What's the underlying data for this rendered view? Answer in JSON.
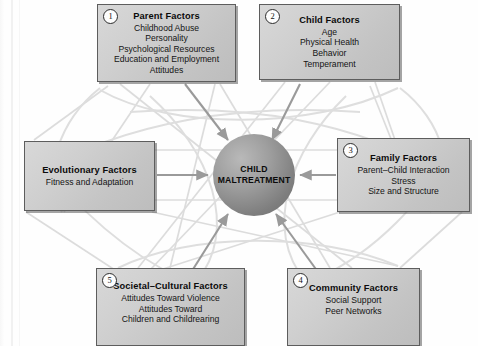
{
  "diagram": {
    "center": {
      "line1": "CHILD",
      "line2": "MALTREATMENT"
    },
    "boxes": [
      {
        "id": "parent-factors",
        "number": "1",
        "title": "Parent Factors",
        "items": [
          "Childhood Abuse",
          "Personality",
          "Psychological Resources",
          "Education and Employment",
          "Attitudes"
        ]
      },
      {
        "id": "child-factors",
        "number": "2",
        "title": "Child Factors",
        "items": [
          "Age",
          "Physical Health",
          "Behavior",
          "Temperament"
        ]
      },
      {
        "id": "family-factors",
        "number": "3",
        "title": "Family Factors",
        "items": [
          "Parent–Child Interaction",
          "Stress",
          "Size and Structure"
        ]
      },
      {
        "id": "community-factors",
        "number": "4",
        "title": "Community Factors",
        "items": [
          "Social Support",
          "Peer Networks"
        ]
      },
      {
        "id": "societal-cultural-factors",
        "number": "5",
        "title": "Societal–Cultural Factors",
        "items": [
          "Attitudes Toward Violence",
          "Attitudes Toward",
          "Children and Childrearing"
        ]
      },
      {
        "id": "evolutionary-factors",
        "number": "",
        "title": "Evolutionary Factors",
        "items": [
          "Fitness and Adaptation"
        ]
      }
    ],
    "colors": {
      "box_fill": "#cfcfcf",
      "box_border": "#5d5d5d",
      "circle_dark": "#6c6c6c",
      "circle_light": "#b9b9b9",
      "arrow": "#9a9a9a",
      "web_line": "#d9d9d9",
      "background": "#fefefe"
    }
  }
}
